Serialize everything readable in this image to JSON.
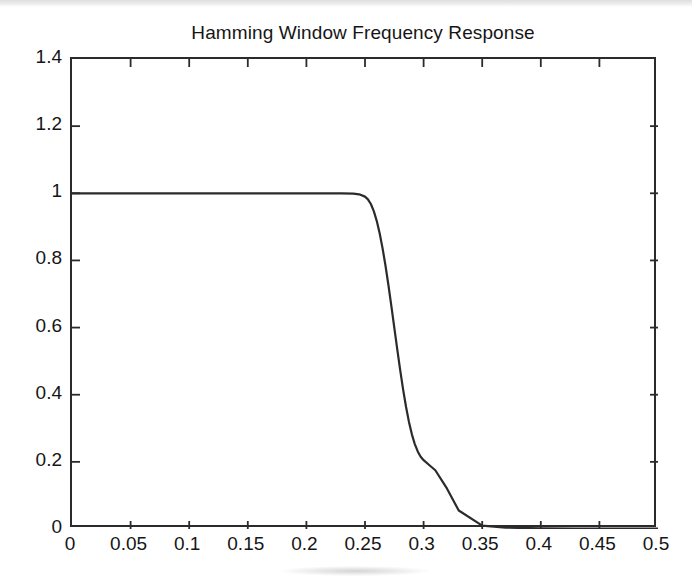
{
  "figure": {
    "background_color": "#ffffff",
    "axis_color": "#2b2b2b",
    "text_color": "#161616",
    "width": 692,
    "height": 586
  },
  "chart_data": {
    "type": "line",
    "title": "Hamming Window Frequency Response",
    "subtitle": "",
    "xlabel": "",
    "ylabel": "",
    "xlim": [
      0,
      0.5
    ],
    "ylim": [
      0,
      1.4
    ],
    "grid": false,
    "legend": null,
    "legend_position": "none",
    "line_color": "#2b2b2b",
    "line_width": 2.2,
    "annotations": [],
    "xticks": [
      0,
      0.05,
      0.1,
      0.15,
      0.2,
      0.25,
      0.3,
      0.35,
      0.4,
      0.45,
      0.5
    ],
    "xtick_labels": [
      "0",
      "0.05",
      "0.1",
      "0.15",
      "0.2",
      "0.25",
      "0.3",
      "0.35",
      "0.4",
      "0.45",
      "0.5"
    ],
    "yticks": [
      0,
      0.2,
      0.4,
      0.6,
      0.8,
      1,
      1.2,
      1.4
    ],
    "ytick_labels": [
      "0",
      "0.2",
      "0.4",
      "0.6",
      "0.8",
      "1",
      "1.2",
      "1.4"
    ],
    "series": [
      {
        "name": "Magnitude response",
        "x": [
          0,
          0.01,
          0.02,
          0.03,
          0.04,
          0.05,
          0.06,
          0.07,
          0.08,
          0.09,
          0.1,
          0.11,
          0.12,
          0.13,
          0.14,
          0.15,
          0.16,
          0.17,
          0.18,
          0.19,
          0.2,
          0.21,
          0.22,
          0.23,
          0.24,
          0.245,
          0.25,
          0.2525,
          0.255,
          0.2575,
          0.26,
          0.2625,
          0.265,
          0.2675,
          0.27,
          0.2725,
          0.275,
          0.2775,
          0.28,
          0.2825,
          0.285,
          0.2875,
          0.29,
          0.2925,
          0.295,
          0.2975,
          0.3,
          0.305,
          0.31,
          0.32,
          0.33,
          0.35,
          0.37,
          0.4,
          0.43,
          0.45,
          0.47,
          0.5
        ],
        "y": [
          1.0,
          1.0,
          1.0,
          1.0,
          1.0,
          1.0,
          1.0,
          1.0,
          1.0,
          1.0,
          1.0,
          1.0,
          1.0,
          1.0,
          1.0,
          1.0,
          1.0,
          1.0,
          1.0,
          1.0,
          1.0,
          1.0,
          1.0,
          1.0,
          0.999,
          0.997,
          0.99,
          0.982,
          0.968,
          0.947,
          0.918,
          0.881,
          0.836,
          0.784,
          0.726,
          0.664,
          0.6,
          0.536,
          0.474,
          0.416,
          0.364,
          0.319,
          0.282,
          0.253,
          0.231,
          0.215,
          0.205,
          0.19,
          0.175,
          0.12,
          0.055,
          0.01,
          0.004,
          0.002,
          0.001,
          0.001,
          0.001,
          0.001
        ]
      }
    ]
  }
}
